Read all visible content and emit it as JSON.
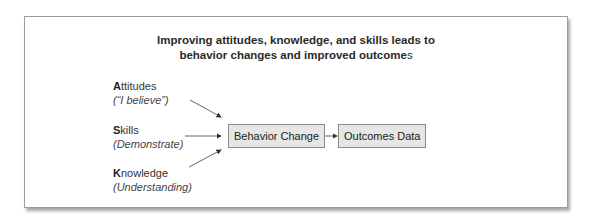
{
  "title": {
    "line1": "Improving attitudes, knowledge, and skills leads to",
    "line2_main": "behavior changes and improved outcome",
    "line2_tail": "s"
  },
  "factors": [
    {
      "initial": "A",
      "rest": "ttitudes",
      "sub": "(“I believe”)"
    },
    {
      "initial": "S",
      "rest": "kills",
      "sub": "(Demonstrate)"
    },
    {
      "initial": "K",
      "rest": "nowledge",
      "sub": "(Understanding)"
    }
  ],
  "nodes": {
    "behavior": "Behavior Change",
    "outcomes": "Outcomes Data"
  },
  "colors": {
    "box_fill": "#e6e6e6",
    "box_border": "#8a8a8a",
    "arrow": "#333333"
  }
}
